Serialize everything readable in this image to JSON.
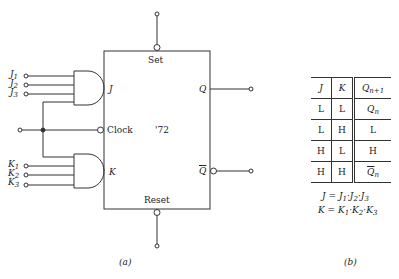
{
  "figure_a": {
    "inputs_j": [
      {
        "base": "J",
        "sub": "1"
      },
      {
        "base": "J",
        "sub": "2"
      },
      {
        "base": "J",
        "sub": "3"
      }
    ],
    "inputs_k": [
      {
        "base": "K",
        "sub": "1"
      },
      {
        "base": "K",
        "sub": "2"
      },
      {
        "base": "K",
        "sub": "3"
      }
    ],
    "chip": {
      "set_label": "Set",
      "reset_label": "Reset",
      "j_label": "J",
      "k_label": "K",
      "clock_label": "Clock",
      "part_label": "'72",
      "q_label": "Q",
      "qbar_label": "Q"
    },
    "caption": "(a)"
  },
  "figure_b": {
    "table": {
      "headers": {
        "j": "J",
        "k": "K",
        "q_base": "Q",
        "q_sub": "n+1"
      },
      "rows": [
        {
          "j": "L",
          "k": "L",
          "q_base": "Q",
          "q_sub": "n",
          "overline": false
        },
        {
          "j": "L",
          "k": "H",
          "q_base": "L",
          "q_sub": "",
          "overline": false
        },
        {
          "j": "H",
          "k": "L",
          "q_base": "H",
          "q_sub": "",
          "overline": false
        },
        {
          "j": "H",
          "k": "H",
          "q_base": "Q",
          "q_sub": "n",
          "overline": true
        }
      ]
    },
    "equations": {
      "j_eq": {
        "lhs": "J",
        "t1": "J",
        "s1": "1",
        "t2": "J",
        "s2": "2",
        "t3": "J",
        "s3": "3"
      },
      "k_eq": {
        "lhs": "K",
        "t1": "K",
        "s1": "1",
        "t2": "K",
        "s2": "2",
        "t3": "K",
        "s3": "3"
      }
    },
    "caption": "(b)"
  }
}
